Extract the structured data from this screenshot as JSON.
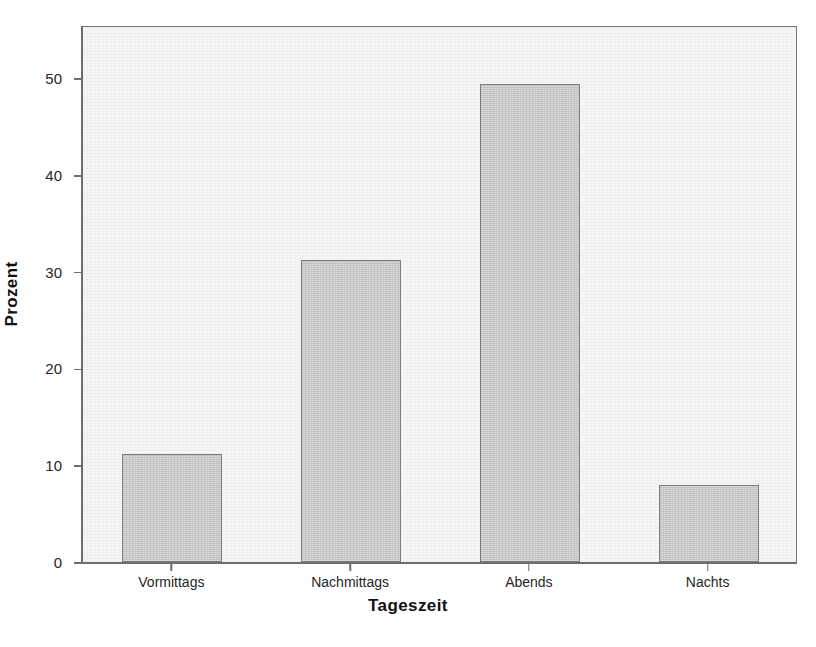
{
  "chart_data": {
    "type": "bar",
    "title": "",
    "subtitle": "",
    "xlabel": "Tageszeit",
    "ylabel": "Prozent",
    "categories": [
      "Vormittags",
      "Nachmittags",
      "Abends",
      "Nachts"
    ],
    "values": [
      11.2,
      31.2,
      49.4,
      8.0
    ],
    "series": [
      {
        "name": "Prozent",
        "values": [
          11.2,
          31.2,
          49.4,
          8.0
        ]
      }
    ],
    "ylim": [
      0,
      55.5
    ],
    "yticks": [
      0,
      10,
      20,
      30,
      40,
      50
    ],
    "ytick_labels": [
      "0",
      "10",
      "20",
      "30",
      "40",
      "50"
    ],
    "grid": false,
    "legend": false,
    "legend_position": "none",
    "annotations": [],
    "colors": {
      "bar_fill": "#c6c6c6",
      "bar_border": "#7d7d7d",
      "plot_background": "#f6f6f4",
      "frame_border": "#777777",
      "axis": "#6e6e6e",
      "text": "#262626",
      "title_text": "#111111",
      "page_background": "#ffffff"
    }
  }
}
